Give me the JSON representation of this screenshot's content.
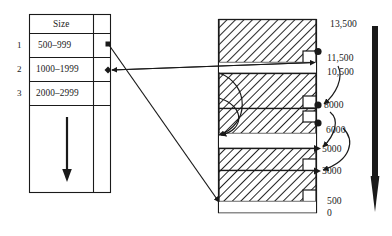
{
  "diagram": {
    "stroke_color": "#1a1a1a",
    "hatch_color": "#1a1a1a",
    "background": "#ffffff"
  },
  "table": {
    "header": {
      "size_label": "Size",
      "pointer_label": ""
    },
    "rows": [
      {
        "num": "1",
        "size": "500–999",
        "marker": "square"
      },
      {
        "num": "2",
        "size": "1000–1999",
        "marker": "diamond"
      },
      {
        "num": "3",
        "size": "2000–2999",
        "marker": "none"
      },
      {
        "num": "",
        "size": "",
        "marker": "none"
      }
    ],
    "down_arrow": {
      "name": "table-down-arrow"
    }
  },
  "memory_column": {
    "blocks": [
      {
        "id": "block-1",
        "kind": "allocated",
        "top_value": "13,500",
        "bottom_value": "11,500"
      },
      {
        "id": "gap-1",
        "kind": "free",
        "top_value": "11,500",
        "bottom_value": "10,500"
      },
      {
        "id": "block-2",
        "kind": "allocated",
        "top_value": "10,500",
        "bottom_value": "8000"
      },
      {
        "id": "block-3",
        "kind": "allocated",
        "top_value": "8000",
        "bottom_value": "6000"
      },
      {
        "id": "gap-2",
        "kind": "free",
        "top_value": "6000",
        "bottom_value": "5000"
      },
      {
        "id": "block-4",
        "kind": "allocated",
        "top_value": "5000",
        "bottom_value": "3000"
      },
      {
        "id": "block-5",
        "kind": "allocated",
        "top_value": "3000",
        "bottom_value": "500"
      },
      {
        "id": "gap-3",
        "kind": "free",
        "top_value": "500",
        "bottom_value": "0"
      }
    ]
  },
  "scale_labels": [
    {
      "text": "13,500",
      "marker": "none"
    },
    {
      "text": "11,500",
      "marker": "circle"
    },
    {
      "text": "10,500",
      "marker": "none"
    },
    {
      "text": "8000",
      "marker": "circle"
    },
    {
      "text": "6000",
      "marker": "circle"
    },
    {
      "text": "5000",
      "marker": "triangle"
    },
    {
      "text": "3000",
      "marker": "triangle"
    },
    {
      "text": "500",
      "marker": "none"
    },
    {
      "text": "0",
      "marker": "none"
    }
  ],
  "address_arrow": {
    "name": "address-direction-arrow",
    "direction": "down"
  }
}
